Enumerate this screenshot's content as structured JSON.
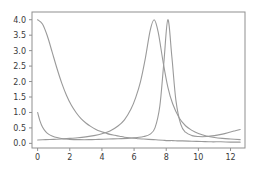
{
  "chart_data": {
    "type": "line",
    "title": "",
    "xlabel": "",
    "ylabel": "",
    "xlim": [
      -0.35,
      12.9
    ],
    "ylim": [
      -0.15,
      4.25
    ],
    "xticks": [
      0,
      2,
      4,
      6,
      8,
      10,
      12
    ],
    "xtick_labels": [
      "0",
      "2",
      "4",
      "6",
      "8",
      "10",
      "12"
    ],
    "yticks": [
      0.0,
      0.5,
      1.0,
      1.5,
      2.0,
      2.5,
      3.0,
      3.5,
      4.0
    ],
    "ytick_labels": [
      "0.0",
      "0.5",
      "1.0",
      "1.5",
      "2.0",
      "2.5",
      "3.0",
      "3.5",
      "4.0"
    ],
    "grid": false,
    "legend": false,
    "frame_color": "#8f8f8f",
    "tick_label_color": "#3a3a3a",
    "background_color": "#ffffff",
    "series": [
      {
        "name": "curve-1",
        "color": "#9a9a9a",
        "peak_x": 0.0,
        "peak_y": 4.0,
        "half_width": 1.55,
        "x": [
          0.0,
          0.3,
          0.6,
          0.9,
          1.2,
          1.5,
          1.8,
          2.1,
          2.4,
          2.7,
          3.0,
          3.3,
          3.6,
          3.9,
          4.2,
          4.5,
          4.8,
          5.1,
          5.4,
          5.7,
          6.0,
          6.3,
          6.6,
          6.9,
          7.2,
          7.5,
          7.8,
          8.1,
          8.4,
          8.7,
          9.0,
          9.6,
          10.2,
          10.8,
          11.4,
          12.0,
          12.6
        ],
        "y": [
          4.0,
          3.86,
          3.48,
          2.96,
          2.43,
          1.95,
          1.55,
          1.23,
          0.99,
          0.8,
          0.66,
          0.55,
          0.46,
          0.39,
          0.34,
          0.29,
          0.26,
          0.23,
          0.2,
          0.18,
          0.17,
          0.15,
          0.14,
          0.13,
          0.12,
          0.11,
          0.1,
          0.09,
          0.09,
          0.08,
          0.08,
          0.07,
          0.06,
          0.05,
          0.05,
          0.04,
          0.04
        ]
      },
      {
        "name": "curve-2",
        "color": "#9a9a9a",
        "peak_x": 7.25,
        "peak_y": 4.0,
        "half_width": 1.6,
        "x": [
          0.0,
          0.5,
          1.0,
          1.5,
          2.0,
          2.5,
          3.0,
          3.5,
          4.0,
          4.5,
          5.0,
          5.4,
          5.8,
          6.1,
          6.4,
          6.7,
          7.0,
          7.25,
          7.5,
          7.8,
          8.1,
          8.4,
          8.8,
          9.2,
          9.6,
          10.0,
          10.5,
          11.0,
          11.5,
          12.0,
          12.6
        ],
        "y": [
          0.11,
          0.12,
          0.13,
          0.14,
          0.16,
          0.18,
          0.21,
          0.25,
          0.31,
          0.4,
          0.56,
          0.76,
          1.1,
          1.48,
          2.0,
          2.75,
          3.65,
          4.0,
          3.6,
          2.65,
          1.82,
          1.28,
          0.83,
          0.57,
          0.42,
          0.32,
          0.24,
          0.19,
          0.16,
          0.14,
          0.12
        ]
      },
      {
        "name": "curve-3",
        "color": "#9a9a9a",
        "peak_x": 8.1,
        "peak_y": 4.0,
        "half_width": 0.58,
        "x": [
          0.0,
          0.15,
          0.3,
          0.5,
          0.7,
          0.9,
          1.2,
          1.6,
          2.0,
          2.6,
          3.2,
          3.8,
          4.4,
          5.0,
          5.6,
          6.2,
          6.6,
          7.0,
          7.3,
          7.6,
          7.85,
          8.1,
          8.35,
          8.6,
          8.9,
          9.2,
          9.6,
          10.0,
          10.5,
          11.0,
          11.5,
          12.0,
          12.3,
          12.6
        ],
        "y": [
          1.0,
          0.72,
          0.53,
          0.38,
          0.29,
          0.24,
          0.19,
          0.15,
          0.13,
          0.12,
          0.12,
          0.13,
          0.14,
          0.15,
          0.16,
          0.19,
          0.22,
          0.3,
          0.5,
          1.2,
          2.6,
          4.0,
          2.8,
          1.4,
          0.62,
          0.36,
          0.25,
          0.22,
          0.22,
          0.25,
          0.3,
          0.37,
          0.41,
          0.45
        ]
      }
    ],
    "annotations": []
  }
}
